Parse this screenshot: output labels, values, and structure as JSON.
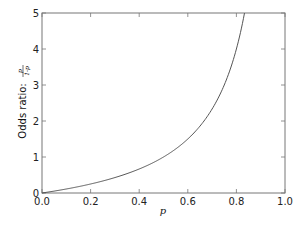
{
  "chart_data": {
    "type": "line",
    "title": "",
    "xlabel": "p",
    "ylabel": "Odds ratio: p/(1-p)",
    "ylabel_prefix": "Odds ratio: ",
    "ylabel_frac_num": "p",
    "ylabel_frac_den": "1-p",
    "xlim": [
      0.0,
      1.0
    ],
    "ylim": [
      0,
      5
    ],
    "grid": false,
    "legend": null,
    "x_ticks": [
      "0.0",
      "0.2",
      "0.4",
      "0.6",
      "0.8",
      "1.0"
    ],
    "y_ticks": [
      "0",
      "1",
      "2",
      "3",
      "4",
      "5"
    ],
    "series": [
      {
        "name": "p/(1-p)",
        "color": "#555555",
        "x": [
          0.0,
          0.05,
          0.1,
          0.15,
          0.2,
          0.25,
          0.3,
          0.35,
          0.4,
          0.45,
          0.5,
          0.55,
          0.6,
          0.65,
          0.7,
          0.75,
          0.8,
          0.8333
        ],
        "y": [
          0.0,
          0.053,
          0.111,
          0.176,
          0.25,
          0.333,
          0.429,
          0.538,
          0.667,
          0.818,
          1.0,
          1.222,
          1.5,
          1.857,
          2.333,
          3.0,
          4.0,
          5.0
        ]
      }
    ]
  }
}
